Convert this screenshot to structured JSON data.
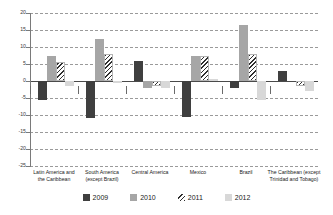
{
  "chart_data": {
    "type": "bar",
    "title": "",
    "subtitle": "",
    "xlabel": "",
    "ylabel": "",
    "ylim": [
      -25,
      20
    ],
    "ytick_step": 5,
    "yticks": [
      20,
      15,
      10,
      5,
      0,
      -5,
      -10,
      -15,
      -20,
      -25
    ],
    "ytick_labels": [
      "20",
      "15",
      "10",
      "5",
      "0",
      "-5",
      "-10",
      "-15",
      "-20",
      "-25"
    ],
    "grid": true,
    "grid_style": "dashed-horizontal",
    "zero_line": true,
    "legend_position": "bottom",
    "categories": [
      "Latin America and the Caribbean",
      "South America (except Brazil)",
      "Central America",
      "Mexico",
      "Brazil",
      "The Caribbean (except Trinidad and Tobago)"
    ],
    "category_label_lines": [
      [
        "Latin America and",
        "the Caribbean"
      ],
      [
        "South America",
        "(except Brazil)"
      ],
      [
        "Central America"
      ],
      [
        "Mexico"
      ],
      [
        "Brazil"
      ],
      [
        "The Caribbean (except",
        "Trinidad and Tobago)"
      ]
    ],
    "series": [
      {
        "name": "2009",
        "color": "#3f3f3f",
        "pattern": "solid",
        "values": [
          -5.5,
          -11.0,
          6.0,
          -10.5,
          -2.0,
          3.0
        ]
      },
      {
        "name": "2010",
        "color": "#a6a6a6",
        "pattern": "solid",
        "values": [
          7.5,
          12.5,
          -2.0,
          7.5,
          16.5,
          0.0
        ]
      },
      {
        "name": "2011",
        "color": "#2f2f2f",
        "pattern": "diagonal-hatch",
        "values": [
          5.5,
          8.0,
          -1.5,
          7.5,
          8.0,
          -1.5
        ]
      },
      {
        "name": "2012",
        "color": "#d8d8d8",
        "pattern": "solid",
        "values": [
          -1.5,
          -0.5,
          -2.0,
          0.5,
          -5.5,
          -3.0
        ]
      }
    ]
  },
  "legend": {
    "items": [
      {
        "label": "2009"
      },
      {
        "label": "2010"
      },
      {
        "label": "2011"
      },
      {
        "label": "2012"
      }
    ]
  }
}
